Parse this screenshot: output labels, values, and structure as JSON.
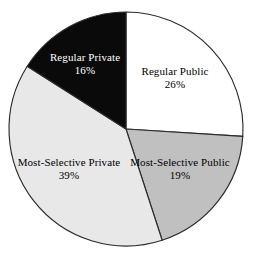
{
  "chart_data": {
    "type": "pie",
    "title": "",
    "subtitle": "",
    "xlabel": "",
    "ylabel": "",
    "legend_position": "none",
    "grid": false,
    "value_unit": "percent",
    "total": 100,
    "start_angle_deg": 0,
    "direction": "clockwise",
    "categories": [
      "Regular Public",
      "Most-Selective Public",
      "Most-Selective Private",
      "Regular Private"
    ],
    "values": [
      26,
      19,
      39,
      16
    ],
    "slices": [
      {
        "label": "Regular Public",
        "value": 26,
        "value_text": "26%",
        "fill": "#ffffff",
        "text_color": "#000000",
        "start_deg": 0,
        "end_deg": 93.6,
        "label_x": 175,
        "label_y": 78
      },
      {
        "label": "Most-Selective Public",
        "value": 19,
        "value_text": "19%",
        "fill": "#c0c0c0",
        "text_color": "#000000",
        "start_deg": 93.6,
        "end_deg": 162.0,
        "label_x": 180,
        "label_y": 169
      },
      {
        "label": "Most-Selective Private",
        "value": 39,
        "value_text": "39%",
        "fill": "#e8e8e8",
        "text_color": "#000000",
        "start_deg": 162.0,
        "end_deg": 302.4,
        "label_x": 69,
        "label_y": 169
      },
      {
        "label": "Regular Private",
        "value": 16,
        "value_text": "16%",
        "fill": "#0a0a0a",
        "text_color": "#ffffff",
        "start_deg": 302.4,
        "end_deg": 360.0,
        "label_x": 85,
        "label_y": 64
      }
    ],
    "geometry": {
      "center_x": 126,
      "center_y": 129,
      "radius": 117
    },
    "colors": {
      "background": "#ffffff",
      "outline": "#2b2b2b",
      "regular_public": "#ffffff",
      "most_selective_public": "#c0c0c0",
      "most_selective_private": "#e8e8e8",
      "regular_private": "#0a0a0a"
    }
  }
}
